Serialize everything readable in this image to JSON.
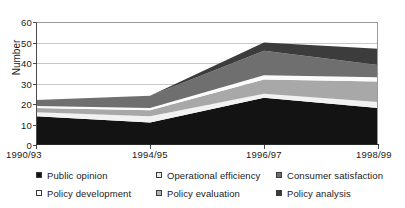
{
  "chart_data": {
    "type": "area",
    "title": "",
    "xlabel": "",
    "ylabel": "Number",
    "categories": [
      "1990/93",
      "1994/95",
      "1996/97",
      "1998/99"
    ],
    "ylim": [
      0,
      60
    ],
    "yticks": [
      0,
      10,
      20,
      30,
      40,
      50,
      60
    ],
    "grid": true,
    "stacked": true,
    "legend_position": "bottom",
    "series": [
      {
        "name": "Public opinion",
        "color": "#131313",
        "values": [
          14,
          11,
          23,
          18
        ]
      },
      {
        "name": "Policy development",
        "color": "#f2f2f2",
        "values": [
          2,
          3,
          2,
          3
        ]
      },
      {
        "name": "Operational efficiency",
        "color": "#a8a8a8",
        "values": [
          2,
          3,
          7,
          10
        ]
      },
      {
        "name": "Policy evaluation",
        "color": "#fbfbfb",
        "values": [
          1,
          1,
          2,
          2
        ]
      },
      {
        "name": "Consumer satisfaction",
        "color": "#6f6f6f",
        "values": [
          3,
          6,
          12,
          6
        ]
      },
      {
        "name": "Policy analysis",
        "color": "#3c3c3c",
        "values": [
          0,
          0,
          4,
          8
        ]
      }
    ],
    "totals": [
      22,
      24,
      50,
      47
    ]
  },
  "axis": {
    "y_label": "Number",
    "y_ticks": [
      "60",
      "50",
      "40",
      "30",
      "20",
      "10",
      "0"
    ],
    "x_ticks": [
      "1990/93",
      "1994/95",
      "1996/97",
      "1998/99"
    ]
  },
  "legend": {
    "items": [
      {
        "label": "Public opinion",
        "swatch": "#131313"
      },
      {
        "label": "Operational efficiency",
        "swatch": "#e9e9e9"
      },
      {
        "label": "Consumer satisfaction",
        "swatch": "#6f6f6f"
      },
      {
        "label": "Policy development",
        "swatch": "#ffffff"
      },
      {
        "label": "Policy evaluation",
        "swatch": "#b4b4b4"
      },
      {
        "label": "Policy analysis",
        "swatch": "#3c3c3c"
      }
    ]
  }
}
